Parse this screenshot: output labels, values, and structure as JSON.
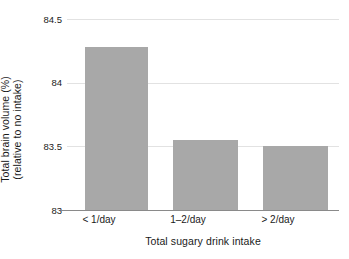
{
  "chart_data": {
    "type": "bar",
    "title": "",
    "categories": [
      "< 1/day",
      "1–2/day",
      "> 2/day"
    ],
    "values": [
      84.28,
      83.55,
      83.5
    ],
    "xlabel": "Total sugary drink intake",
    "ylabel": "Total brain volume (%)",
    "ylabel_line2": "(relative to no intake)",
    "ylim": [
      83,
      84.5
    ],
    "yticks": [
      "83",
      "83.5",
      "84",
      "84.5"
    ],
    "ytick_values": [
      83,
      83.5,
      84,
      84.5
    ],
    "grid": true,
    "legend": "none",
    "bar_color": "#a8a8a8",
    "grid_color": "#e2e2e2",
    "axis_color": "#8a8a8a"
  }
}
